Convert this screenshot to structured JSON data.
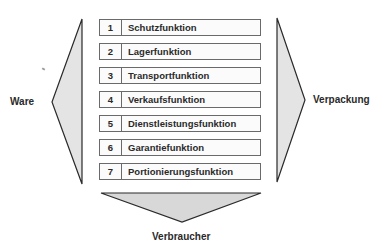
{
  "diagram": {
    "left_label": "Ware",
    "right_label": "Verpackung",
    "bottom_label": "Verbraucher",
    "functions": [
      {
        "number": "1",
        "label": "Schutzfunktion"
      },
      {
        "number": "2",
        "label": "Lagerfunktion"
      },
      {
        "number": "3",
        "label": "Transportfunktion"
      },
      {
        "number": "4",
        "label": "Verkaufsfunktion"
      },
      {
        "number": "5",
        "label": "Dienstleistungsfunktion"
      },
      {
        "number": "6",
        "label": "Garantiefunktion"
      },
      {
        "number": "7",
        "label": "Portionierungsfunktion"
      }
    ],
    "colors": {
      "arrow_fill": "#e4e4e4",
      "arrow_stroke": "#2a2a2a",
      "box_border": "#6a6a6a"
    }
  }
}
